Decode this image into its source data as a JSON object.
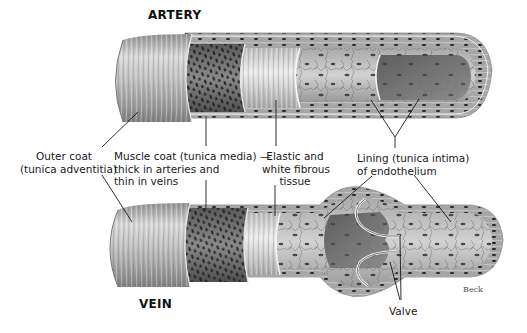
{
  "diagram": {
    "type": "anatomical-illustration",
    "titles": {
      "artery": "ARTERY",
      "vein": "VEIN"
    },
    "labels": {
      "outer_coat": [
        "Outer coat",
        "(tunica adventitia)"
      ],
      "muscle_coat": [
        "Muscle coat (tunica media) —",
        "thick in arteries and",
        "thin in veins"
      ],
      "elastic_tissue": [
        "Elastic and",
        "white fibrous",
        "tissue"
      ],
      "lining": [
        "Lining (tunica intima)",
        "of endothelium"
      ],
      "valve": "Valve"
    },
    "signature": "Beck",
    "colors": {
      "background": "#ffffff",
      "outer_coat": "#b8b8b8",
      "muscle_coat": "#6e6e6e",
      "elastic_layer": "#d0d0d0",
      "lining_light": "#c4c4c4",
      "lining_dark": "#7a7a7a",
      "nuclei": "#222222",
      "leader_lines": "#1a1a1a"
    }
  }
}
